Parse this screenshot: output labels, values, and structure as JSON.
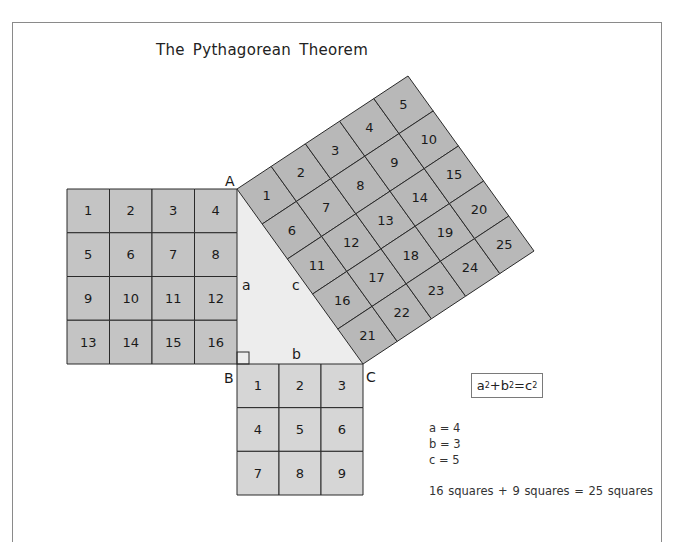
{
  "title": "The Pythagorean Theorem",
  "colors": {
    "square_a_fill": "#c4c4c4",
    "square_b_fill": "#d6d6d6",
    "square_c_fill": "#b8b8b8",
    "triangle_fill": "#ededed",
    "grid_line": "#2a2a2a",
    "frame_border": "#8a8a8a"
  },
  "vertices": {
    "A": {
      "label": "A",
      "x": 237,
      "y": 189
    },
    "B": {
      "label": "B",
      "x": 237,
      "y": 364
    },
    "C": {
      "label": "C",
      "x": 363,
      "y": 364
    },
    "T": {
      "x": 408,
      "y": 76
    }
  },
  "side_labels": {
    "a": "a",
    "b": "b",
    "c": "c"
  },
  "square_a": {
    "side": 4,
    "cells": [
      "1",
      "2",
      "3",
      "4",
      "5",
      "6",
      "7",
      "8",
      "9",
      "10",
      "11",
      "12",
      "13",
      "14",
      "15",
      "16"
    ]
  },
  "square_b": {
    "side": 3,
    "cells": [
      "1",
      "2",
      "3",
      "4",
      "5",
      "6",
      "7",
      "8",
      "9"
    ]
  },
  "square_c": {
    "side": 5,
    "cells": [
      "1",
      "2",
      "3",
      "4",
      "5",
      "6",
      "7",
      "8",
      "9",
      "10",
      "11",
      "12",
      "13",
      "14",
      "15",
      "16",
      "17",
      "18",
      "19",
      "20",
      "21",
      "22",
      "23",
      "24",
      "25"
    ]
  },
  "formula": {
    "a": "a",
    "sup_a": "2",
    "plus": "+b",
    "sup_b": "2",
    "eq": "=c",
    "sup_c": "2"
  },
  "legend": {
    "a_value": "a = 4",
    "b_value": "b = 3",
    "c_value": "c = 5"
  },
  "summary": "16 squares + 9 squares  = 25 squares"
}
